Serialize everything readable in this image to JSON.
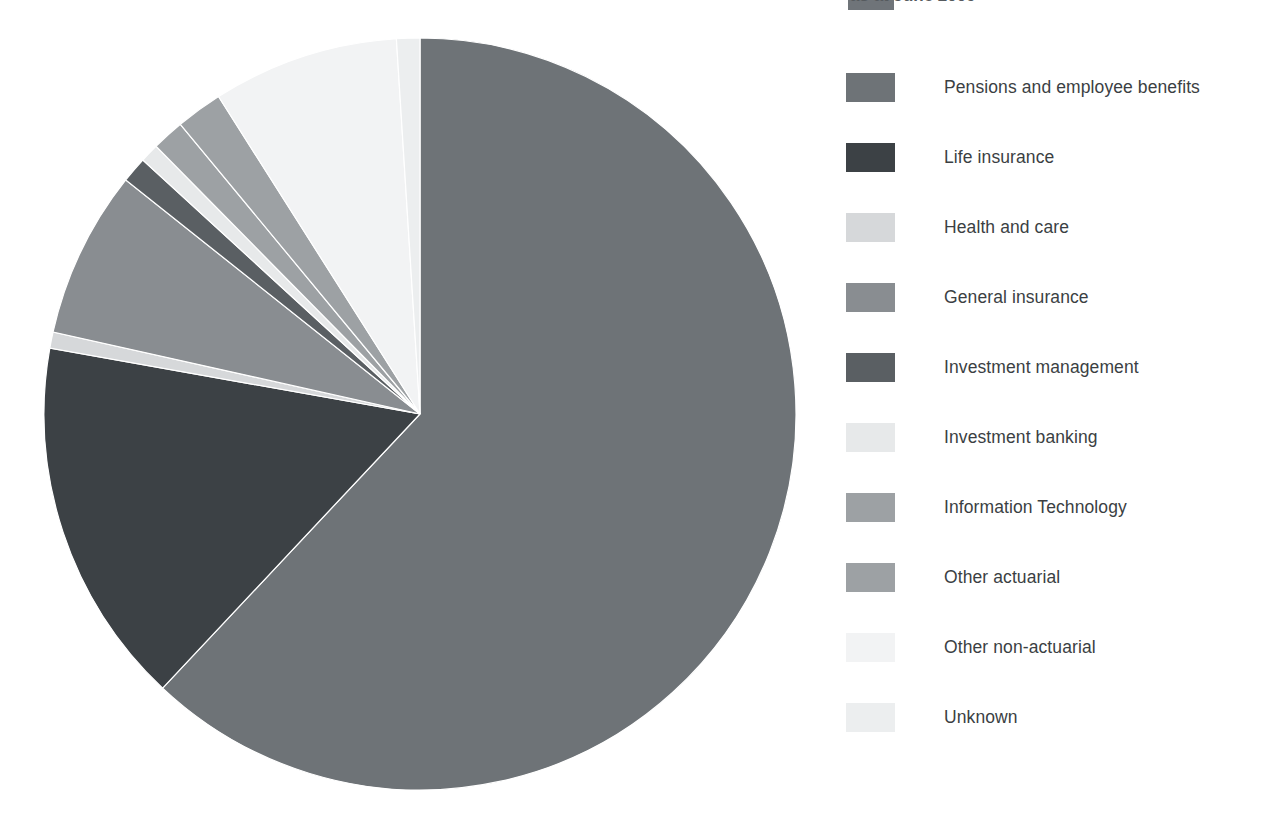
{
  "header": {
    "title_fragment": "as at June 2009",
    "visible": true
  },
  "legend": {
    "position": "right",
    "items": [
      {
        "label": "Pensions and employee benefits",
        "color": "#6e7377"
      },
      {
        "label": "Life insurance",
        "color": "#3c4145"
      },
      {
        "label": "Health and care",
        "color": "#d6d8da"
      },
      {
        "label": "General insurance",
        "color": "#898d91"
      },
      {
        "label": "Investment management",
        "color": "#5a5f63"
      },
      {
        "label": "Investment banking",
        "color": "#e7e9ea"
      },
      {
        "label": "Information Technology",
        "color": "#9da1a4"
      },
      {
        "label": "Other actuarial",
        "color": "#9da1a4"
      },
      {
        "label": "Other non-actuarial",
        "color": "#f2f3f4"
      },
      {
        "label": "Unknown",
        "color": "#eceeef"
      }
    ]
  },
  "chart_data": {
    "type": "pie",
    "title": "as at June 2009",
    "xlabel": "",
    "ylabel": "",
    "legend_position": "right",
    "grid": false,
    "start_angle_deg": 0,
    "direction": "clockwise",
    "center": {
      "x": 420,
      "y": 414
    },
    "radius": 376,
    "labels": [
      "Pensions and employee benefits",
      "Life insurance",
      "Health and care",
      "General insurance",
      "Investment management",
      "Investment banking",
      "Information Technology",
      "Other actuarial",
      "Other non-actuarial",
      "Unknown"
    ],
    "values": [
      62.0,
      15.8,
      0.7,
      7.2,
      1.1,
      0.8,
      1.4,
      2.0,
      8.0,
      1.0
    ],
    "colors": [
      "#6e7377",
      "#3c4145",
      "#d6d8da",
      "#898d91",
      "#5a5f63",
      "#e7e9ea",
      "#9da1a4",
      "#9da1a4",
      "#f2f3f4",
      "#eceeef"
    ],
    "slices": [
      {
        "label": "Pensions and employee benefits",
        "value": 62.0,
        "start_deg": 0.0,
        "end_deg": 223.2,
        "color": "#6e7377"
      },
      {
        "label": "Life insurance",
        "value": 15.8,
        "start_deg": 223.2,
        "end_deg": 280.1,
        "color": "#3c4145"
      },
      {
        "label": "Health and care",
        "value": 0.7,
        "start_deg": 280.1,
        "end_deg": 282.6,
        "color": "#d6d8da"
      },
      {
        "label": "General insurance",
        "value": 7.2,
        "start_deg": 282.6,
        "end_deg": 308.5,
        "color": "#898d91"
      },
      {
        "label": "Investment management",
        "value": 1.1,
        "start_deg": 308.5,
        "end_deg": 312.5,
        "color": "#5a5f63"
      },
      {
        "label": "Investment banking",
        "value": 0.8,
        "start_deg": 312.5,
        "end_deg": 315.4,
        "color": "#e7e9ea"
      },
      {
        "label": "Information Technology",
        "value": 1.4,
        "start_deg": 315.4,
        "end_deg": 320.4,
        "color": "#9da1a4"
      },
      {
        "label": "Other actuarial",
        "value": 2.0,
        "start_deg": 320.4,
        "end_deg": 327.6,
        "color": "#9da1a4"
      },
      {
        "label": "Other non-actuarial",
        "value": 8.0,
        "start_deg": 327.6,
        "end_deg": 356.4,
        "color": "#f2f3f4"
      },
      {
        "label": "Unknown",
        "value": 1.0,
        "start_deg": 356.4,
        "end_deg": 360.0,
        "color": "#eceeef"
      }
    ]
  }
}
